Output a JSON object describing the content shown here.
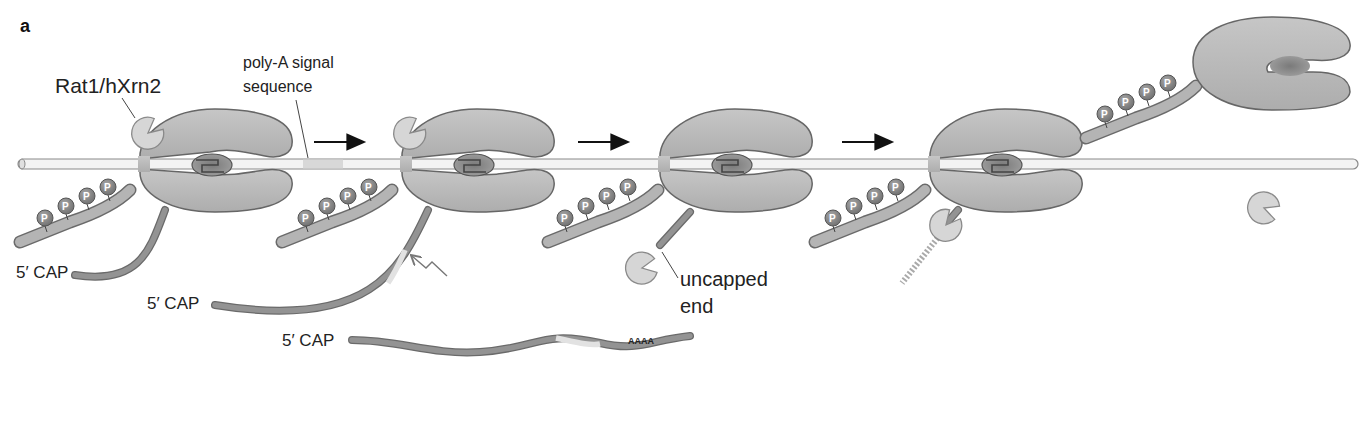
{
  "panel_letter": "a",
  "labels": {
    "rat1": "Rat1/hXrn2",
    "polya_line1": "poly-A signal",
    "polya_line2": "sequence",
    "cap1": "5′ CAP",
    "cap2": "5′ CAP",
    "cap3": "5′ CAP",
    "uncapped_line1": "uncapped",
    "uncapped_line2": "end",
    "polya_tail": "AAAA",
    "phospho": "P"
  },
  "icons": {
    "arrow": "right-arrow-icon",
    "cleavage": "lightning-arrow-icon",
    "exonuclease": "pacman-exonuclease-icon",
    "polymerase": "rna-polymerase-ii-icon"
  },
  "colors": {
    "polymerase": "#b8b8b8",
    "polymerase_stroke": "#6a6a6a",
    "dna": "#f2f2f2",
    "dna_stroke": "#8a8a8a",
    "rna": "#8e8e8e",
    "exonuclease": "#d4d4d4",
    "phospho_bead": "#8a8a8a",
    "polya_signal": "#d8d8d8",
    "text": "#222222"
  },
  "stages": [
    {
      "id": 1,
      "description": "Pol II transcribing with Rat1/hXrn2 bound, 5' capped RNA"
    },
    {
      "id": 2,
      "description": "Transcription through poly-A signal; cleavage site indicated"
    },
    {
      "id": 3,
      "description": "Cleavage releases mRNA; Rat1 engages uncapped end"
    },
    {
      "id": 4,
      "description": "Rat1 degrades nascent RNA toward polymerase"
    },
    {
      "id": 5,
      "description": "Pol II released from DNA template; Rat1 released"
    }
  ]
}
